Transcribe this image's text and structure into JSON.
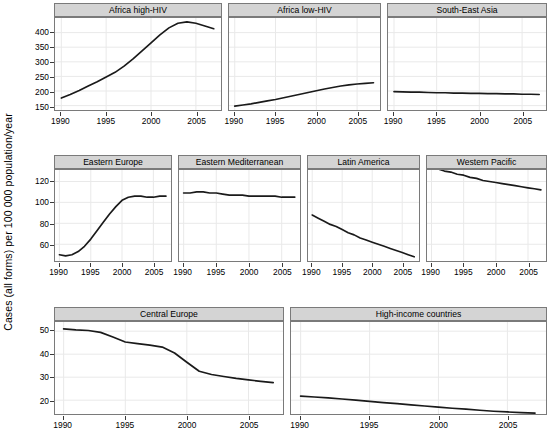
{
  "chart_data": {
    "type": "line",
    "title": "",
    "ylabel": "Cases (all forms) per 100 000 population/year",
    "xlabel": "",
    "layout": "trellis 3 rows: row1 3 panels, row2 4 panels, row3 2 panels",
    "grid": true,
    "legend": "none",
    "x": [
      1990,
      1991,
      1992,
      1993,
      1994,
      1995,
      1996,
      1997,
      1998,
      1999,
      2000,
      2001,
      2002,
      2003,
      2004,
      2005,
      2006,
      2007
    ],
    "xlim": [
      1989.3,
      2007.8
    ],
    "xticks": [
      1990,
      1995,
      2000,
      2005
    ],
    "xticklabels": [
      "1990",
      "1995",
      "2000",
      "2005"
    ],
    "rows": [
      {
        "row_index": 0,
        "ylim": [
          135,
          450
        ],
        "yticks": [
          150,
          200,
          250,
          300,
          350,
          400
        ],
        "yticklabels": [
          "150",
          "200",
          "250",
          "300",
          "350",
          "400"
        ],
        "panels": [
          {
            "name": "Africa high-HIV",
            "values": [
              176,
              188,
              202,
              217,
              232,
              248,
              264,
              285,
              310,
              337,
              365,
              392,
              416,
              432,
              437,
              432,
              423,
              413
            ]
          },
          {
            "name": "Africa low-HIV",
            "values": [
              148,
              152,
              156,
              161,
              166,
              171,
              177,
              183,
              189,
              195,
              201,
              207,
              212,
              217,
              221,
              224,
              226,
              228
            ]
          },
          {
            "name": "South-East Asia",
            "values": [
              198,
              197,
              196,
              196,
              195,
              194,
              194,
              193,
              193,
              192,
              192,
              191,
              191,
              190,
              190,
              189,
              189,
              188
            ]
          }
        ]
      },
      {
        "row_index": 1,
        "ylim": [
          44,
          131
        ],
        "yticks": [
          60,
          80,
          100,
          120
        ],
        "yticklabels": [
          "60",
          "80",
          "100",
          "120"
        ],
        "panels": [
          {
            "name": "Eastern Europe",
            "values": [
              50,
              49,
              50,
              53,
              58,
              65,
              73,
              81,
              89,
              96,
              102,
              105,
              106,
              106,
              105,
              105,
              106,
              106
            ]
          },
          {
            "name": "Eastern Mediterranean",
            "values": [
              109,
              109,
              110,
              110,
              109,
              109,
              108,
              107,
              107,
              107,
              106,
              106,
              106,
              106,
              106,
              105,
              105,
              105
            ]
          },
          {
            "name": "Latin America",
            "values": [
              88,
              85,
              82,
              79,
              77,
              74,
              71,
              69,
              66,
              64,
              62,
              60,
              58,
              56,
              54,
              52,
              50,
              48
            ]
          },
          {
            "name": "Western Pacific",
            "values": [
              133,
              132,
              130,
              129,
              127,
              126,
              124,
              123,
              121,
              120,
              119,
              118,
              117,
              116,
              115,
              114,
              113,
              112
            ]
          }
        ]
      },
      {
        "row_index": 2,
        "ylim": [
          14,
          54
        ],
        "yticks": [
          20,
          30,
          40,
          50
        ],
        "yticklabels": [
          "20",
          "30",
          "40",
          "50"
        ],
        "panels": [
          {
            "name": "Central Europe",
            "values": [
              51,
              50.6,
              50.3,
              49.5,
              47.5,
              45.3,
              44.6,
              43.9,
              43.1,
              40.5,
              36.5,
              32.6,
              31.2,
              30.3,
              29.5,
              28.8,
              28.2,
              27.6
            ]
          },
          {
            "name": "High-income countries",
            "values": [
              21.8,
              21.4,
              21.0,
              20.5,
              20.0,
              19.5,
              19.0,
              18.5,
              18.0,
              17.5,
              17.0,
              16.5,
              16.1,
              15.6,
              15.2,
              14.9,
              14.6,
              14.4
            ]
          }
        ]
      }
    ]
  }
}
